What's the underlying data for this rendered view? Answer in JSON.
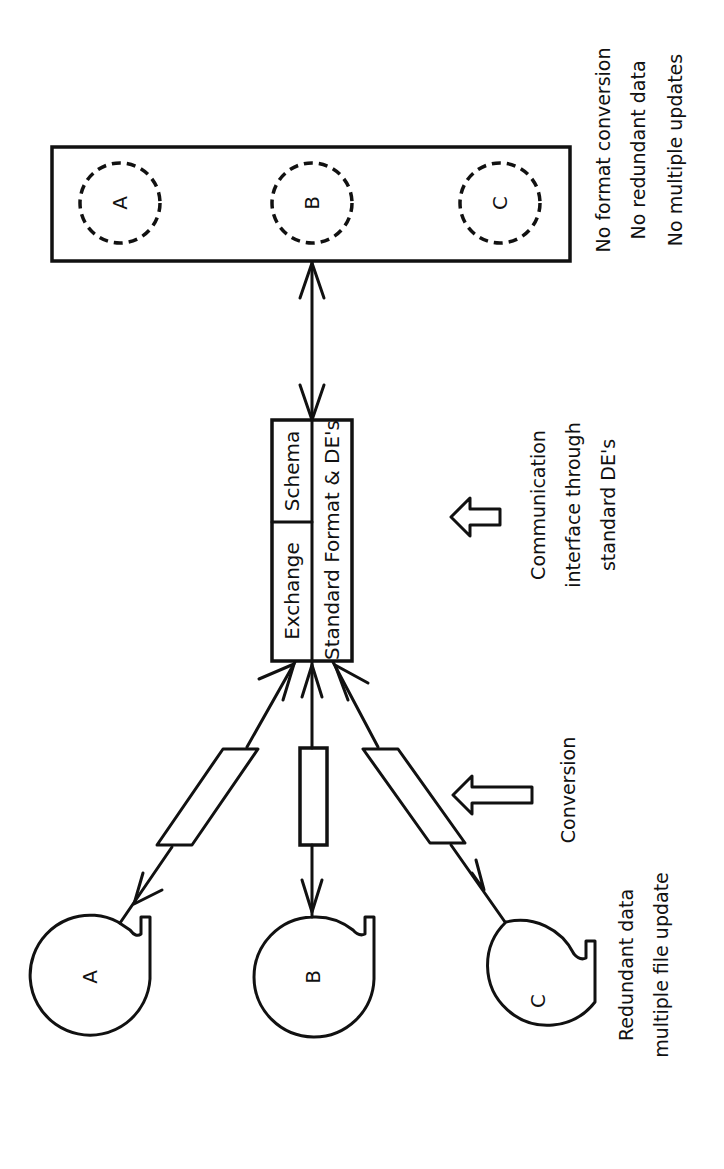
{
  "diagram": {
    "orientation": "rotated -90deg",
    "left_system": {
      "tapes": [
        {
          "label": "A"
        },
        {
          "label": "B"
        },
        {
          "label": "C"
        }
      ],
      "caption_line1": "Redundant data",
      "caption_line2": "multiple file update",
      "conversion_label": "Conversion"
    },
    "exchange": {
      "top_left_label": "Exchange",
      "top_right_label": "Schema",
      "bottom_label": "Standard Format & DE's",
      "caption_line1": "Communication",
      "caption_line2": "interface through",
      "caption_line3": "standard DE's"
    },
    "right_system": {
      "files": [
        {
          "label": "A"
        },
        {
          "label": "B"
        },
        {
          "label": "C"
        }
      ],
      "notes": [
        "No format conversion",
        "No redundant data",
        "No multiple updates"
      ]
    }
  }
}
